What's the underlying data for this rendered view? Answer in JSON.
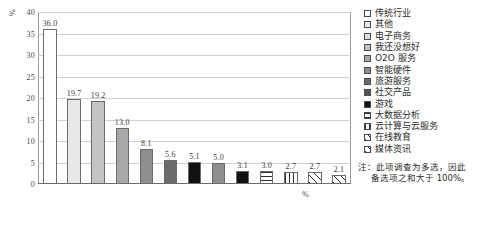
{
  "chart_data": {
    "type": "bar",
    "title": "",
    "xlabel": "%",
    "ylabel": "%",
    "ylim": [
      0,
      40
    ],
    "ytick_values": [
      0,
      5,
      10,
      15,
      20,
      25,
      30,
      35,
      40
    ],
    "ytick_labels": [
      "0",
      "5",
      "10",
      "15",
      "20",
      "25",
      "30",
      "35",
      "40"
    ],
    "grid": true,
    "legend_position": "right",
    "categories": [
      "传统行业",
      "其他",
      "电子商务",
      "我还没想好",
      "O2O 服务",
      "智能硬件",
      "旅游服务",
      "社交产品",
      "游戏",
      "大数据分析",
      "云计算与云服务",
      "在线教育",
      "媒体资讯"
    ],
    "values": [
      36.0,
      19.7,
      19.2,
      13.0,
      8.1,
      5.6,
      5.1,
      5.0,
      3.1,
      3.0,
      2.7,
      2.7,
      2.1
    ],
    "value_labels": [
      "36.0",
      "19.7",
      "19.2",
      "13.0",
      "8.1",
      "5.6",
      "5.1",
      "5.0",
      "3.1",
      "3.0",
      "2.7",
      "2.7",
      "2.1"
    ],
    "fills": [
      "f-white",
      "f-g1",
      "f-g3",
      "f-g4",
      "f-g5",
      "f-g6",
      "f-black",
      "f-g5",
      "f-black",
      "f-hline",
      "f-vline",
      "f-diag",
      "f-diag"
    ],
    "legend_fills": [
      "f-white",
      "f-g1",
      "f-g2",
      "f-g3",
      "f-g4",
      "f-g5",
      "f-g6",
      "f-g7",
      "f-black",
      "f-hline",
      "f-vline",
      "f-diag",
      "f-diag"
    ],
    "annotation": {
      "line1": "注：此项调查为多选，因此",
      "line2": "备选项之和大于 100%。"
    },
    "colors": {
      "grid": "#cfcfcf",
      "axis": "#6e6e6e",
      "bar_border": "#6b6b6b",
      "text": "#2b2b2b"
    }
  }
}
